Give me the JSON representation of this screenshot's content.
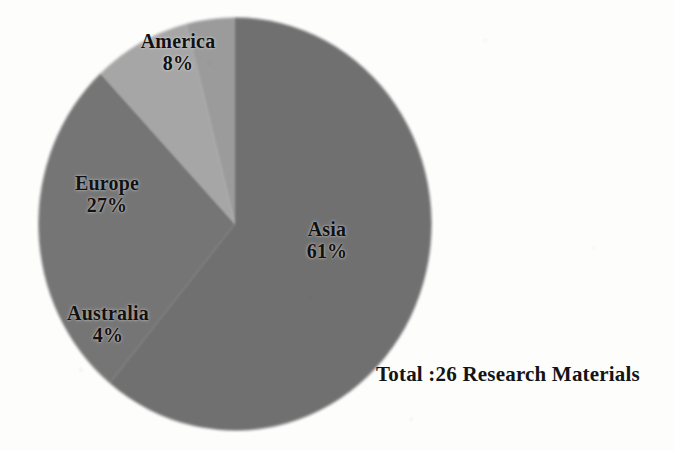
{
  "figure": {
    "background_color": "#fdfdfc",
    "total_caption": "Total :26 Research Materials"
  },
  "chart_data": {
    "type": "pie",
    "title": "",
    "subtitle": "",
    "xlabel": "",
    "ylabel": "",
    "legend_position": "none",
    "grid": false,
    "labels_inside_slices": true,
    "start_angle_deg": 90,
    "direction": "clockwise",
    "total_label": "Total :26 Research Materials",
    "total_count": 26,
    "total_units": "Research Materials",
    "categories": [
      "Asia",
      "Europe",
      "America",
      "Australia"
    ],
    "values": [
      61,
      27,
      8,
      4
    ],
    "value_unit": "percent",
    "slices": [
      {
        "name": "Asia",
        "value": 61,
        "percent_label": "61%",
        "color": "#6f6f6f",
        "label_name": "Asia",
        "label_pct": "61%"
      },
      {
        "name": "Europe",
        "value": 27,
        "percent_label": "27%",
        "color": "#757575",
        "label_name": "Europe",
        "label_pct": "27%"
      },
      {
        "name": "America",
        "value": 8,
        "percent_label": "8%",
        "color": "#a6a6a6",
        "label_name": "America",
        "label_pct": "8%"
      },
      {
        "name": "Australia",
        "value": 4,
        "percent_label": "4%",
        "color": "#9b9b9b",
        "label_name": "Australia",
        "label_pct": "4%"
      }
    ],
    "geometry": {
      "center_x": 235,
      "center_y": 224,
      "radius_x": 197,
      "radius_y": 207
    }
  }
}
